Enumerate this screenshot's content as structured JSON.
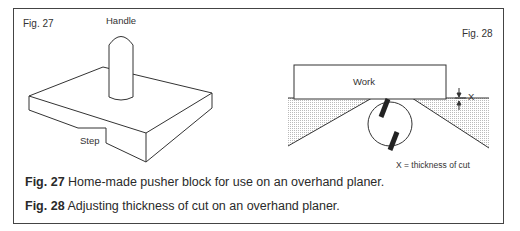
{
  "figures": {
    "fig27": {
      "label": "Fig. 27",
      "parts": {
        "handle": "Handle",
        "step": "Step"
      }
    },
    "fig28": {
      "label": "Fig. 28",
      "parts": {
        "work": "Work",
        "x_marker": "X"
      },
      "legend": "X = thickness of cut"
    }
  },
  "captions": [
    {
      "ref": "Fig. 27",
      "text": "Home-made pusher block for use on an overhand planer."
    },
    {
      "ref": "Fig. 28",
      "text": "Adjusting thickness of cut on an overhand planer."
    }
  ]
}
